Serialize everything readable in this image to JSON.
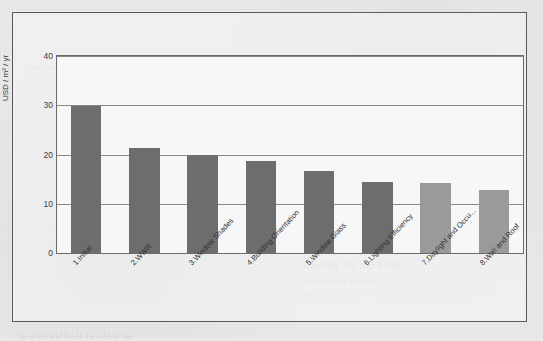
{
  "chart_data": {
    "type": "bar",
    "title": "",
    "xlabel": "",
    "ylabel": "USD / m² / yr",
    "ylim": [
      0,
      40
    ],
    "yticks": [
      0,
      10,
      20,
      30,
      40
    ],
    "grid": true,
    "legend": null,
    "categories": [
      "1.Initial",
      "2.WWR",
      "3.Window Shades",
      "4.Building Orientation",
      "5.Window Glass",
      "6.Lighting Efficiency",
      "7.Daylight and Occu...",
      "8.Wall and Roof"
    ],
    "values": [
      29.8,
      21.4,
      20.0,
      18.6,
      16.7,
      14.5,
      14.2,
      12.7
    ],
    "bar_colors": [
      "#6d6d6d",
      "#6d6d6d",
      "#6d6d6d",
      "#6d6d6d",
      "#6d6d6d",
      "#6d6d6d",
      "#9a9a9a",
      "#9a9a9a"
    ]
  },
  "figure": {
    "frame_color": "#595959",
    "plot_background": "#f7f7f7",
    "gridline_color": "#888888",
    "page_background": "#e9e9e9"
  },
  "background_bleed": [
    {
      "text": "the the to the the of the of a the the",
      "x": 30,
      "y": 62,
      "size": 9
    },
    {
      "text": "and the building energy cost and",
      "x": 150,
      "y": 92,
      "size": 9
    },
    {
      "text": "the of individual measures",
      "x": 205,
      "y": 106,
      "size": 9
    },
    {
      "text": "of the energy use for",
      "x": 235,
      "y": 120,
      "size": 8
    },
    {
      "text": "a the of the of the for the of",
      "x": 60,
      "y": 150,
      "size": 8
    },
    {
      "text": "the of the and the",
      "x": 250,
      "y": 176,
      "size": 8
    },
    {
      "text": "and of the",
      "x": 330,
      "y": 192,
      "size": 8
    },
    {
      "text": "Shading for the Fifth",
      "x": 300,
      "y": 258,
      "size": 12
    },
    {
      "text": "simple of the and the",
      "x": 300,
      "y": 276,
      "size": 9
    },
    {
      "text": "the of the to the",
      "x": 300,
      "y": 290,
      "size": 9
    },
    {
      "text": "the of the and the of the a the of the",
      "x": 18,
      "y": 332,
      "size": 8
    }
  ]
}
